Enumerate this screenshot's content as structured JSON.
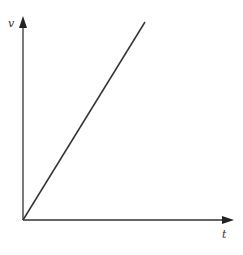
{
  "chart_data": {
    "type": "line",
    "title": "",
    "xlabel": "t",
    "ylabel": "v",
    "series": [
      {
        "name": "v(t)",
        "x": [
          0,
          1
        ],
        "y": [
          0,
          1
        ]
      }
    ],
    "xlim": [
      0,
      1
    ],
    "ylim": [
      0,
      1
    ],
    "grid": false,
    "legend": "none",
    "ticks": false
  },
  "colors": {
    "axis": "#333333",
    "line": "#333333",
    "background": "#ffffff"
  }
}
